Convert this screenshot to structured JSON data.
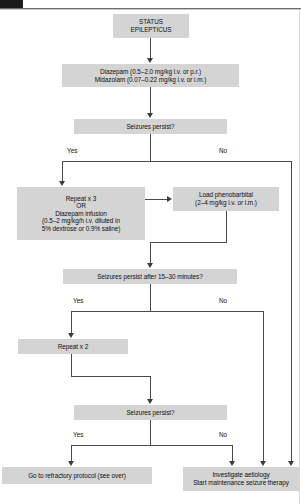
{
  "page": {
    "corner_marker": "page-tab-marker"
  },
  "nodes": {
    "status_epilepticus": {
      "id": "status-epilepticus",
      "lines": [
        "STATUS",
        "EPILEPTICUS"
      ]
    },
    "first_line_drugs": {
      "id": "first-line-drugs",
      "lines": [
        "Diazepam (0.5–2.0 mg/kg i.v. or p.r.)",
        "Midazolam (0.07–0.22 mg/kg i.v. or i.m.)"
      ]
    },
    "seizures_persist_1": {
      "id": "seizures-persist-1",
      "lines": [
        "Seizures persist?"
      ]
    },
    "repeat_x3": {
      "id": "repeat-x3",
      "lines": [
        "Repeat x 3",
        "OR",
        "Diazepam infusion",
        "(0.5–2 mg/kg/h i.v. diluted in",
        "5% dextrose or 0.9% saline)"
      ]
    },
    "load_phenobarbital": {
      "id": "load-phenobarbital",
      "lines": [
        "Load phenobarbital",
        "(2–4 mg/kg i.v. or i.m.)"
      ]
    },
    "seizures_persist_2": {
      "id": "seizures-persist-2",
      "lines": [
        "Seizures persist after 15–30 minutes?"
      ]
    },
    "repeat_x2": {
      "id": "repeat-x2",
      "lines": [
        "Repeat x 2"
      ]
    },
    "seizures_persist_3": {
      "id": "seizures-persist-3",
      "lines": [
        "Seizures persist?"
      ]
    },
    "refractory_protocol": {
      "id": "refractory-protocol",
      "lines": [
        "Go to refractory protocol (see over)"
      ]
    },
    "investigate_aetiology": {
      "id": "investigate-aetiology",
      "lines": [
        "Investigate aetiology",
        "Start maintenance seizure therapy"
      ]
    }
  },
  "branch_labels": {
    "d1_yes": "Yes",
    "d1_no": "No",
    "d2_yes": "Yes",
    "d2_no": "No",
    "d3_yes": "Yes",
    "d3_no": "No"
  },
  "colors": {
    "box_fill": "#d4d4d4",
    "text": "#101010",
    "connector": "#4a4a4a",
    "marker": "#1a1a1a",
    "page_bg": "#ffffff"
  }
}
